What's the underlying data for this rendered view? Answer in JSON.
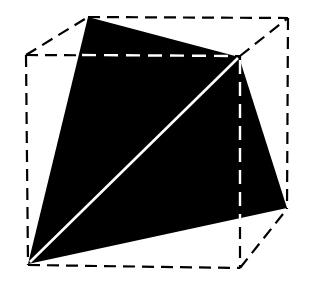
{
  "figure": {
    "colors": {
      "background": "#ffffff",
      "fill": "#000000",
      "edge": "#000000",
      "highlight": "#ffffff"
    },
    "cube": {
      "front": {
        "tl": [
          26,
          55
        ],
        "tr": [
          240,
          56
        ],
        "br": [
          240,
          268
        ],
        "bl": [
          28,
          265
        ]
      },
      "back": {
        "tl": [
          88,
          17
        ],
        "tr": [
          288,
          18
        ],
        "br": [
          287,
          209
        ],
        "bl": [
          28,
          265
        ]
      }
    },
    "tetrahedron": {
      "vertices": [
        [
          88,
          17
        ],
        [
          239,
          57
        ],
        [
          287,
          208
        ],
        [
          28,
          264
        ]
      ]
    }
  }
}
